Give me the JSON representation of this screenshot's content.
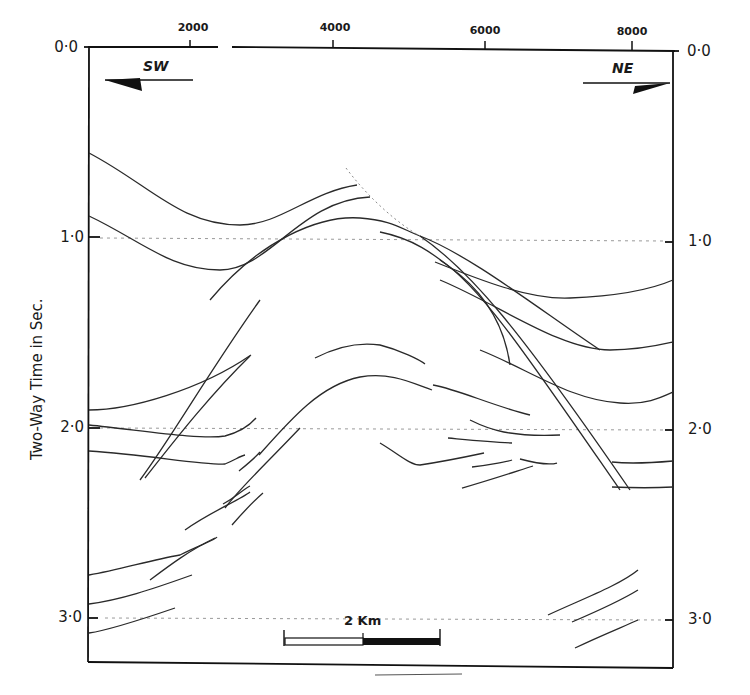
{
  "figure": {
    "type": "seismic-interpretation-cross-section",
    "y_axis_title": "Two-Way Time in Sec.",
    "x_axis_ticks": [
      {
        "label": "2000",
        "x": 190
      },
      {
        "label": "4000",
        "x": 333
      },
      {
        "label": "6000",
        "x": 485
      },
      {
        "label": "8000",
        "x": 632
      }
    ],
    "y_axis_ticks_left": [
      {
        "label": "0·0",
        "y": 47
      },
      {
        "label": "1·0",
        "y": 238
      },
      {
        "label": "2·0",
        "y": 428
      },
      {
        "label": "3·0",
        "y": 620
      }
    ],
    "y_axis_ticks_right": [
      {
        "label": "0·0",
        "y": 47
      },
      {
        "label": "1·0",
        "y": 238
      },
      {
        "label": "2·0",
        "y": 428
      },
      {
        "label": "3·0",
        "y": 620
      }
    ],
    "direction_left": "SW",
    "direction_right": "NE",
    "scale_bar": {
      "label": "2 Km"
    },
    "line_color": "#2a2a2a",
    "frame_color": "#111111",
    "gridline_color": "#9a9a9a"
  }
}
